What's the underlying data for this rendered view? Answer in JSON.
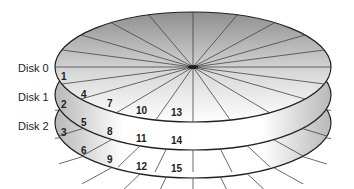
{
  "diagram": {
    "type": "disk-striping",
    "disks": [
      {
        "label": "Disk 0",
        "blocks": [
          "1",
          "4",
          "7",
          "10",
          "13"
        ]
      },
      {
        "label": "Disk 1",
        "blocks": [
          "2",
          "5",
          "8",
          "11",
          "14"
        ]
      },
      {
        "label": "Disk 2",
        "blocks": [
          "3",
          "6",
          "9",
          "12",
          "15"
        ]
      }
    ],
    "colors": {
      "stroke": "#222222",
      "shade_dark": "#9a9a9a",
      "shade_light": "#ffffff"
    }
  }
}
